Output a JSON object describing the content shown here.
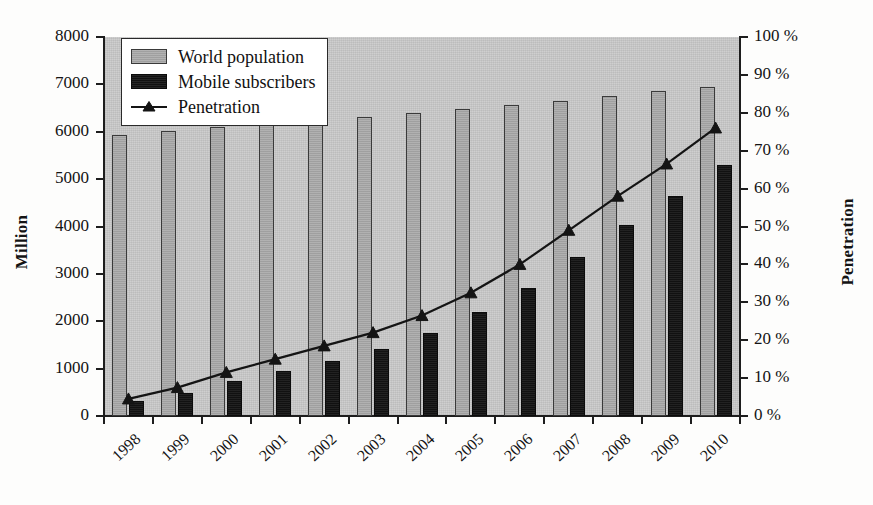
{
  "chart_data": {
    "type": "bar",
    "title": "",
    "subtitle": "",
    "xlabel": "",
    "ylabel": "Million",
    "y2label": "Penetration",
    "grid": false,
    "legend_position": "top-left",
    "categories": [
      "1998",
      "1999",
      "2000",
      "2001",
      "2002",
      "2003",
      "2004",
      "2005",
      "2006",
      "2007",
      "2008",
      "2009",
      "2010"
    ],
    "ylim": [
      0,
      8000
    ],
    "ytick_labels": [
      "0",
      "1000",
      "2000",
      "3000",
      "4000",
      "5000",
      "6000",
      "7000",
      "8000"
    ],
    "ytick_values": [
      0,
      1000,
      2000,
      3000,
      4000,
      5000,
      6000,
      7000,
      8000
    ],
    "y2lim": [
      0,
      100
    ],
    "y2tick_labels": [
      "0 %",
      "10 %",
      "20 %",
      "30 %",
      "40 %",
      "50 %",
      "60 %",
      "70 %",
      "80 %",
      "90 %",
      "100 %"
    ],
    "y2tick_values": [
      0,
      10,
      20,
      30,
      40,
      50,
      60,
      70,
      80,
      90,
      100
    ],
    "series": [
      {
        "name": "World population",
        "type": "bar",
        "axis": "left",
        "unit": "Million",
        "color": "#a8a8a8",
        "values": [
          5930,
          6010,
          6090,
          6160,
          6230,
          6310,
          6400,
          6480,
          6560,
          6650,
          6750,
          6850,
          6950
        ]
      },
      {
        "name": "Mobile subscribers",
        "type": "bar",
        "axis": "left",
        "unit": "Million",
        "color": "#151515",
        "values": [
          320,
          490,
          740,
          960,
          1160,
          1420,
          1760,
          2200,
          2700,
          3350,
          4030,
          4650,
          5300
        ]
      },
      {
        "name": "Penetration",
        "type": "line",
        "axis": "right",
        "unit": "%",
        "color": "#141414",
        "marker": "triangle",
        "values": [
          4.5,
          7.5,
          11.5,
          15,
          18.5,
          22,
          26.5,
          32.5,
          40,
          49,
          58,
          66.5,
          76
        ]
      }
    ]
  },
  "legend": {
    "items": [
      {
        "label": "World population",
        "key": "swatch-gray"
      },
      {
        "label": "Mobile subscribers",
        "key": "swatch-black"
      },
      {
        "label": "Penetration",
        "key": "line-marker-triangle"
      }
    ]
  },
  "colors": {
    "plot_background": "#c9c9c9",
    "population_bar": "#a8a8a8",
    "mobile_bar": "#151515",
    "penetration_line": "#141414",
    "axis": "#1d1d1d",
    "legend_background": "#ffffff"
  }
}
